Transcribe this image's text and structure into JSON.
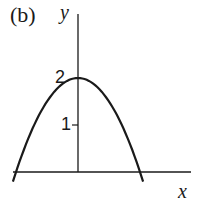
{
  "chart_data": {
    "type": "line",
    "panel_label": "(b)",
    "title": "",
    "xlabel": "x",
    "ylabel": "y",
    "y_ticks": [
      1,
      2
    ],
    "y_tick_labels": [
      "1",
      "2"
    ],
    "x_ticks": [],
    "grid": false,
    "legend": null,
    "series": [
      {
        "name": "downward parabola",
        "equation": "y = 2 - 2x^2 (x in units of root distance)",
        "x": [
          -1.05,
          -0.75,
          -0.5,
          -0.25,
          0,
          0.25,
          0.5,
          0.75,
          1.05
        ],
        "values": [
          -0.2,
          0.875,
          1.5,
          1.875,
          2,
          1.875,
          1.5,
          0.875,
          -0.2
        ]
      }
    ],
    "ylim": [
      -0.3,
      3.7
    ],
    "xlim": [
      -1.05,
      1.8
    ],
    "annotations": [
      "vertex at (0, 2)",
      "x-intercepts symmetric about y-axis"
    ]
  },
  "labels": {
    "panel": "(b)",
    "x_axis": "x",
    "y_axis": "y",
    "tick_2": "2",
    "tick_1": "1"
  }
}
